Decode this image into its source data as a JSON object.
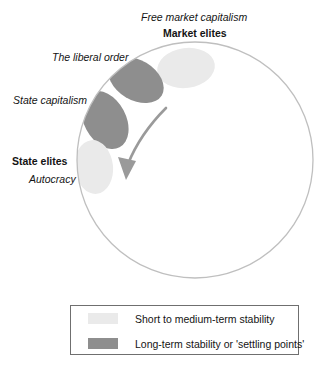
{
  "diagram": {
    "title_labels": {
      "free_market_capitalism": "Free market capitalism",
      "market_elites": "Market elites",
      "liberal_order": "The liberal order",
      "state_capitalism": "State capitalism",
      "state_elites": "State elites",
      "autocracy": "Autocracy"
    },
    "legend": {
      "items": [
        {
          "label": "Short to medium-term stability",
          "color": "#eaeaea",
          "swatch_name": "light-gray-swatch"
        },
        {
          "label": "Long-term stability or 'settling points'",
          "color": "#8e8e8e",
          "swatch_name": "dark-gray-swatch"
        }
      ],
      "border_color": "#6f6f6f"
    },
    "colors": {
      "light_zone": "#eaeaea",
      "dark_zone": "#8e8e8e",
      "circle_stroke": "#bfbfbf",
      "arrow": "#9a9a9a",
      "text": "#141414",
      "background": "#ffffff"
    },
    "zones": [
      {
        "name": "market-elites-zone",
        "category": "short-to-medium-term",
        "fill": "#eaeaea"
      },
      {
        "name": "liberal-order-zone",
        "category": "long-term",
        "fill": "#8e8e8e"
      },
      {
        "name": "state-capitalism-zone",
        "category": "long-term",
        "fill": "#8e8e8e"
      },
      {
        "name": "state-elites-zone",
        "category": "short-to-medium-term",
        "fill": "#eaeaea"
      }
    ],
    "arrow": {
      "name": "clockwise-trend-arrow",
      "direction": "from market elites toward state elites"
    }
  }
}
